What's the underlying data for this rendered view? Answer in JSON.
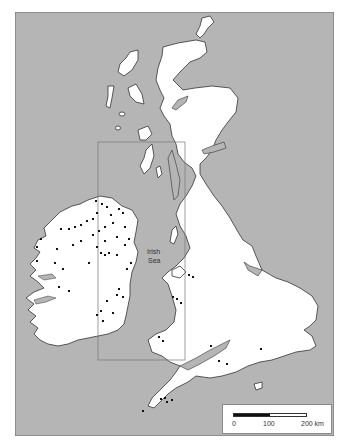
{
  "map": {
    "colors": {
      "sea": "#b5b5b5",
      "land": "#ffffff",
      "coast": "#333333",
      "site": "#111111",
      "inset_frame": "#777777"
    },
    "labels": {
      "sea_line1": "Irish",
      "sea_line2": "Sea"
    },
    "inset_box": {
      "x": 98,
      "y": 142,
      "width": 87,
      "height": 218
    },
    "scale_bar": {
      "tick_0": "0",
      "tick_100": "100",
      "tick_200": "200 km"
    }
  }
}
